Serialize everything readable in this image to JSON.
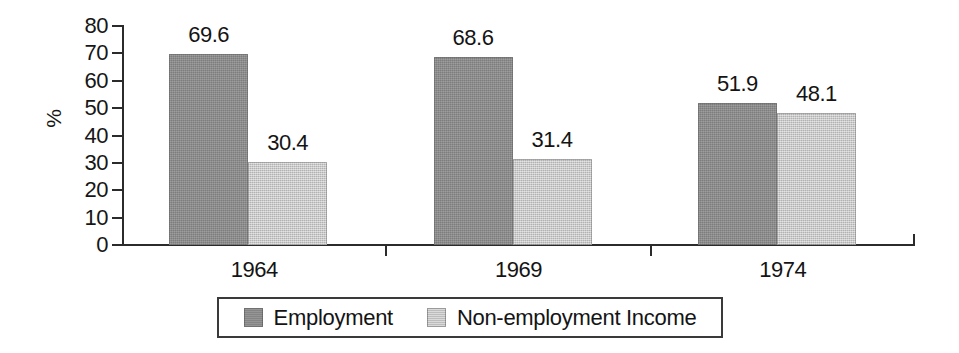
{
  "chart_data": {
    "type": "bar",
    "title": "",
    "subtitle": "",
    "xlabel": "",
    "ylabel": "%",
    "categories": [
      "1964",
      "1969",
      "1974"
    ],
    "series": [
      {
        "name": "Employment",
        "values": [
          69.6,
          68.6,
          51.9
        ],
        "color": "#8b8b8b"
      },
      {
        "name": "Non-employment Income",
        "values": [
          30.4,
          31.4,
          48.1
        ],
        "color": "#c6c6c6"
      }
    ],
    "data_labels": [
      [
        "69.6",
        "30.4"
      ],
      [
        "68.6",
        "31.4"
      ],
      [
        "51.9",
        "48.1"
      ]
    ],
    "ylim": [
      0,
      80
    ],
    "y_ticks": [
      0,
      10,
      20,
      30,
      40,
      50,
      60,
      70,
      80
    ],
    "y_tick_labels": [
      "0",
      "10",
      "20",
      "30",
      "40",
      "50",
      "60",
      "70",
      "80"
    ],
    "grid": false,
    "legend_position": "bottom",
    "bars_grouped": true,
    "bar_gap_within_group": 0
  },
  "legend": {
    "entries": [
      {
        "label": "Employment",
        "swatch": "dark-gray-swatch"
      },
      {
        "label": "Non-employment Income",
        "swatch": "light-gray-swatch"
      }
    ]
  }
}
